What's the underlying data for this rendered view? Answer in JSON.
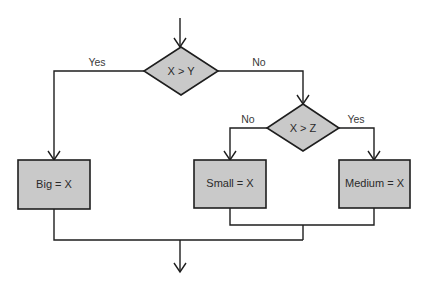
{
  "diagram": {
    "type": "flowchart",
    "colors": {
      "node_fill": "#c9c9c9",
      "stroke": "#1e1e1e",
      "text": "#2a2a2a",
      "background": "#ffffff"
    },
    "decisions": [
      {
        "id": "d1",
        "label": "X > Y"
      },
      {
        "id": "d2",
        "label": "X > Z"
      }
    ],
    "processes": [
      {
        "id": "p1",
        "label": "Big = X"
      },
      {
        "id": "p2",
        "label": "Small = X"
      },
      {
        "id": "p3",
        "label": "Medium = X"
      }
    ],
    "edge_labels": {
      "d1_yes": "Yes",
      "d1_no": "No",
      "d2_no": "No",
      "d2_yes": "Yes"
    }
  }
}
